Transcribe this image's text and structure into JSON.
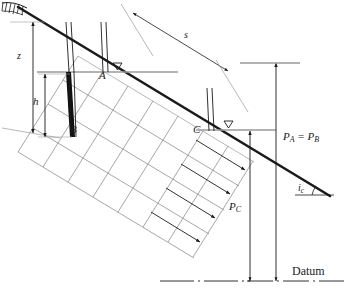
{
  "figure": {
    "type": "engineering-diagram",
    "background_color": "#ffffff",
    "ink_color": "#1a1a1a",
    "flownet_color": "#808080"
  },
  "labels": {
    "point_a": "A",
    "point_b": "B",
    "point_c": "C",
    "depth_z": "z",
    "head_h": "h",
    "seepage_s": "s",
    "pressure_ab": "P",
    "pressure_ab_sub_1": "A",
    "pressure_ab_eq": " = ",
    "pressure_ab_2": "P",
    "pressure_ab_sub_2": "B",
    "pressure_c": "P",
    "pressure_c_sub": "C",
    "angle_i": "i",
    "angle_i_sub": "c",
    "datum": "Datum",
    "water_table_symbol": "▽"
  },
  "label_texts": {
    "pa_eq_pb": "P_A = P_B",
    "pc": "P_C",
    "ic": "i_c"
  },
  "elements": {
    "ground_surface": "slope-surface-line",
    "water_table_a": "water-table-line-a",
    "water_table_c": "water-table-line-c",
    "piezometer_a": "piezometer-standpipe-a",
    "piezometer_b": "piezometer-standpipe-b-filled",
    "piezometer_c": "piezometer-standpipe-c",
    "flow_net": "flow-net-grid",
    "flow_arrows": "seepage-flow-arrows",
    "datum_line": "datum-dash-dot-line",
    "hatching": "ground-hatching-symbol"
  },
  "geometry": {
    "slope_angle_deg": 24,
    "flownet_rows": 4,
    "flownet_cols": 7,
    "flow_arrow_count": 4
  }
}
